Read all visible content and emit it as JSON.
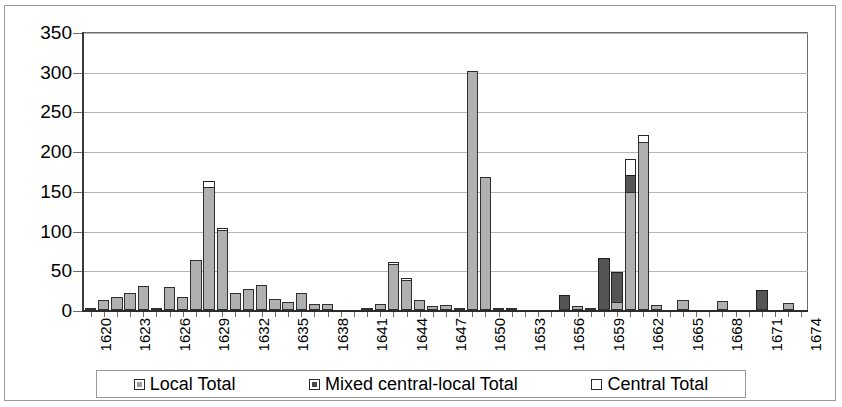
{
  "chart_data": {
    "type": "bar",
    "stacked": true,
    "title": "",
    "subtitle": "",
    "xlabel": "",
    "ylabel": "",
    "ylim": [
      0,
      350
    ],
    "ytick_labels": [
      "0",
      "50",
      "100",
      "150",
      "200",
      "250",
      "300",
      "350"
    ],
    "ytick_values": [
      0,
      50,
      100,
      150,
      200,
      250,
      300,
      350
    ],
    "grid": true,
    "legend_position": "bottom",
    "x": [
      1620,
      1621,
      1622,
      1623,
      1624,
      1625,
      1626,
      1627,
      1628,
      1629,
      1630,
      1631,
      1632,
      1633,
      1634,
      1635,
      1636,
      1637,
      1638,
      1639,
      1640,
      1641,
      1642,
      1643,
      1644,
      1645,
      1646,
      1647,
      1648,
      1649,
      1650,
      1651,
      1652,
      1653,
      1654,
      1655,
      1656,
      1657,
      1658,
      1659,
      1660,
      1661,
      1662,
      1663,
      1664,
      1665,
      1666,
      1667,
      1668,
      1669,
      1670,
      1671,
      1672,
      1673,
      1674
    ],
    "xtick_labels": [
      "1620",
      "1623",
      "1626",
      "1629",
      "1632",
      "1635",
      "1638",
      "1641",
      "1644",
      "1647",
      "1650",
      "1653",
      "1656",
      "1659",
      "1662",
      "1665",
      "1668",
      "1671",
      "1674"
    ],
    "series": [
      {
        "name": "Local Total",
        "color": "#b0b0b0",
        "values": [
          2,
          13,
          17,
          22,
          30,
          1,
          29,
          17,
          63,
          155,
          101,
          22,
          26,
          31,
          14,
          10,
          21,
          7,
          7,
          0,
          0,
          2,
          7,
          58,
          38,
          12,
          5,
          6,
          2,
          301,
          167,
          2,
          1,
          0,
          0,
          0,
          0,
          5,
          3,
          0,
          10,
          148,
          212,
          6,
          0,
          12,
          0,
          0,
          11,
          0,
          0,
          0,
          0,
          9,
          0
        ]
      },
      {
        "name": "Mixed central-local Total",
        "color": "#555555",
        "values": [
          0,
          0,
          0,
          0,
          0,
          0,
          0,
          0,
          0,
          0,
          0,
          0,
          0,
          0,
          0,
          0,
          0,
          0,
          0,
          0,
          0,
          0,
          0,
          0,
          0,
          0,
          0,
          0,
          0,
          0,
          0,
          0,
          0,
          0,
          0,
          0,
          19,
          0,
          0,
          65,
          38,
          22,
          0,
          0,
          0,
          0,
          0,
          0,
          0,
          0,
          0,
          25,
          0,
          0,
          0
        ]
      },
      {
        "name": "Central Total",
        "color": "#ffffff",
        "values": [
          0,
          0,
          0,
          0,
          0,
          0,
          0,
          0,
          0,
          7,
          1,
          0,
          0,
          0,
          0,
          0,
          0,
          0,
          0,
          0,
          0,
          0,
          0,
          3,
          1,
          0,
          0,
          0,
          0,
          0,
          0,
          0,
          0,
          0,
          0,
          0,
          0,
          0,
          0,
          0,
          0,
          20,
          8,
          0,
          0,
          0,
          0,
          0,
          0,
          0,
          0,
          0,
          0,
          0,
          0
        ]
      }
    ]
  }
}
